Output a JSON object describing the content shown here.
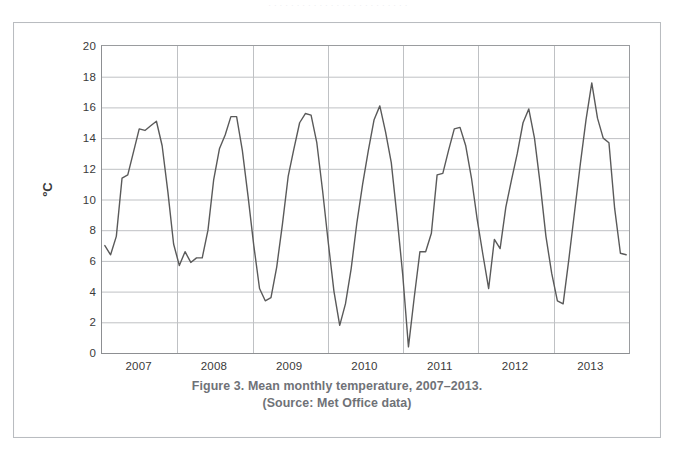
{
  "page": {
    "top_faint_text": "· · · · · · · · · · · · · · · · · · · · · · · · ·"
  },
  "caption": {
    "line1": "Figure 3. Mean monthly temperature, 2007–2013.",
    "line2": "(Source: Met Office data)"
  },
  "chart_data": {
    "type": "line",
    "title": "Figure 3. Mean monthly temperature, 2007–2013.",
    "subtitle": "(Source: Met Office data)",
    "xlabel": "",
    "ylabel": "ºC",
    "ylim": [
      0,
      20
    ],
    "ytick_step": 2,
    "yticks": [
      20,
      18,
      16,
      14,
      12,
      10,
      8,
      6,
      4,
      2,
      0
    ],
    "xtick_labels": [
      "2007",
      "2008",
      "2009",
      "2010",
      "2011",
      "2012",
      "2013"
    ],
    "grid": "horizontal-and-vertical",
    "legend": "none",
    "line_color": "#5a5a5a",
    "grid_color": "#bfc1c4",
    "series": [
      {
        "name": "Mean monthly temperature",
        "unit": "ºC",
        "x_start": "2007-01",
        "x_step": "1 month",
        "n_points": 84,
        "values": [
          7.0,
          6.4,
          7.6,
          11.4,
          11.6,
          13.1,
          14.6,
          14.5,
          14.8,
          15.1,
          13.5,
          10.5,
          7.1,
          5.7,
          6.6,
          5.9,
          6.2,
          6.2,
          8.0,
          11.3,
          13.3,
          14.2,
          15.4,
          15.4,
          13.2,
          10.2,
          7.0,
          4.2,
          3.4,
          3.6,
          5.6,
          8.4,
          11.5,
          13.3,
          15.0,
          15.6,
          15.5,
          13.7,
          10.6,
          7.2,
          4.0,
          1.8,
          3.2,
          5.5,
          8.5,
          11.0,
          13.2,
          15.2,
          16.1,
          14.4,
          12.4,
          8.9,
          5.1,
          0.4,
          3.6,
          6.6,
          6.6,
          7.8,
          11.6,
          11.7,
          13.2,
          14.6,
          14.7,
          13.5,
          11.4,
          8.7,
          6.4,
          4.2,
          7.4,
          6.8,
          9.5,
          11.3,
          13.0,
          15.0,
          15.9,
          14.0,
          11.0,
          7.6,
          5.2,
          3.4,
          3.2,
          6.1,
          9.2,
          12.3,
          15.2,
          17.6,
          15.3,
          14.0,
          13.7,
          9.4,
          6.5,
          6.4
        ]
      }
    ]
  }
}
